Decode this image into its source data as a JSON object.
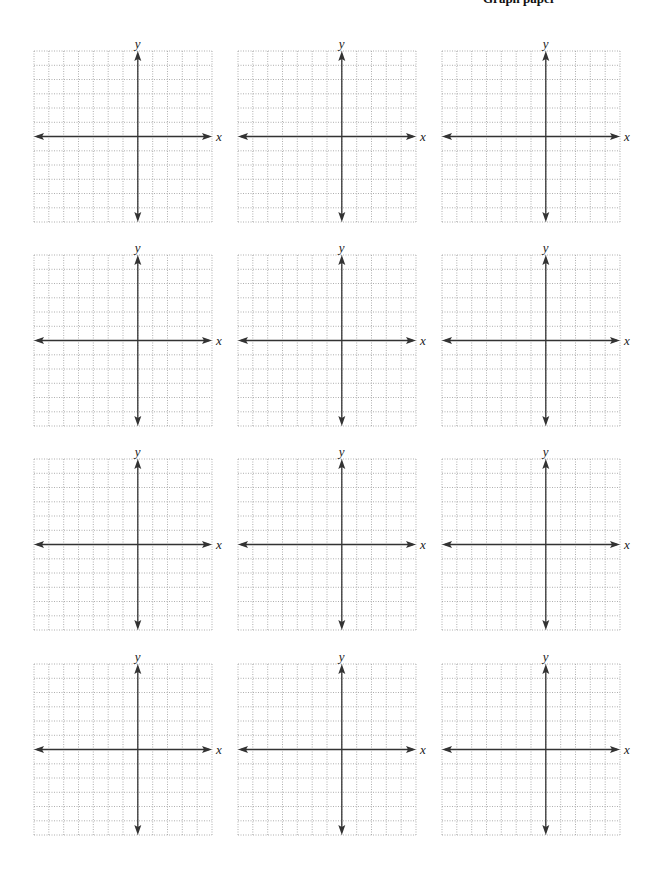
{
  "page": {
    "header_clipped_text": "Graph paper",
    "grid_color": "#9a9a9a",
    "axis_color": "#333333"
  },
  "plots": [
    {
      "x_label": "x",
      "y_label": "y"
    },
    {
      "x_label": "x",
      "y_label": "y"
    },
    {
      "x_label": "x",
      "y_label": "y"
    },
    {
      "x_label": "x",
      "y_label": "y"
    },
    {
      "x_label": "x",
      "y_label": "y"
    },
    {
      "x_label": "x",
      "y_label": "y"
    },
    {
      "x_label": "x",
      "y_label": "y"
    },
    {
      "x_label": "x",
      "y_label": "y"
    },
    {
      "x_label": "x",
      "y_label": "y"
    },
    {
      "x_label": "x",
      "y_label": "y"
    },
    {
      "x_label": "x",
      "y_label": "y"
    },
    {
      "x_label": "x",
      "y_label": "y"
    }
  ],
  "grid_spec": {
    "columns": 12,
    "rows": 12,
    "layout": "4 rows x 3 columns of blank coordinate planes"
  }
}
